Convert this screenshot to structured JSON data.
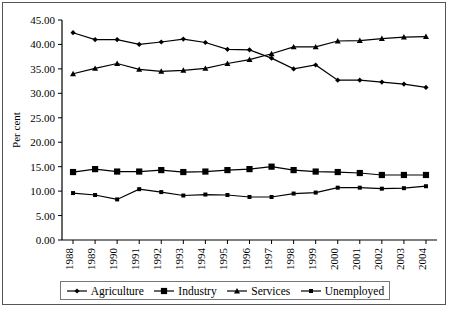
{
  "chart_data": {
    "type": "line",
    "title": "",
    "xlabel": "",
    "ylabel": "Per cent",
    "ylim": [
      0,
      45
    ],
    "ytick_step": 5,
    "ytick_labels": [
      "0.00",
      "5.00",
      "10.00",
      "15.00",
      "20.00",
      "25.00",
      "30.00",
      "35.00",
      "40.00",
      "45.00"
    ],
    "grid": false,
    "legend_position": "bottom",
    "categories": [
      "1988",
      "1989",
      "1990",
      "1991",
      "1992",
      "1993",
      "1994",
      "1995",
      "1996",
      "1997",
      "1998",
      "1999",
      "2000",
      "2001",
      "2002",
      "2003",
      "2004"
    ],
    "series": [
      {
        "name": "Agriculture",
        "marker": "diamond",
        "color": "#000000",
        "values": [
          42.4,
          41.0,
          41.0,
          40.0,
          40.5,
          41.1,
          40.4,
          39.0,
          38.9,
          37.2,
          35.0,
          35.8,
          32.7,
          32.7,
          32.3,
          31.9,
          31.2
        ]
      },
      {
        "name": "Industry",
        "marker": "square-large",
        "color": "#000000",
        "values": [
          13.9,
          14.5,
          14.0,
          14.0,
          14.3,
          13.9,
          14.0,
          14.3,
          14.5,
          15.0,
          14.3,
          14.0,
          13.9,
          13.7,
          13.3,
          13.3,
          13.3
        ]
      },
      {
        "name": "Services",
        "marker": "triangle",
        "color": "#000000",
        "values": [
          34.0,
          35.1,
          36.1,
          34.9,
          34.5,
          34.7,
          35.1,
          36.1,
          36.9,
          38.1,
          39.5,
          39.5,
          40.7,
          40.8,
          41.2,
          41.5,
          41.6
        ]
      },
      {
        "name": "Unemployed",
        "marker": "square-small",
        "color": "#000000",
        "values": [
          9.6,
          9.2,
          8.3,
          10.4,
          9.8,
          9.1,
          9.3,
          9.2,
          8.8,
          8.8,
          9.5,
          9.7,
          10.7,
          10.7,
          10.5,
          10.6,
          11.0
        ]
      }
    ]
  },
  "axis": {
    "y_title": "Per cent"
  },
  "legend": {
    "items": [
      {
        "label": "Agriculture",
        "marker": "diamond"
      },
      {
        "label": "Industry",
        "marker": "square-large"
      },
      {
        "label": "Services",
        "marker": "triangle"
      },
      {
        "label": "Unemployed",
        "marker": "square-small"
      }
    ]
  }
}
